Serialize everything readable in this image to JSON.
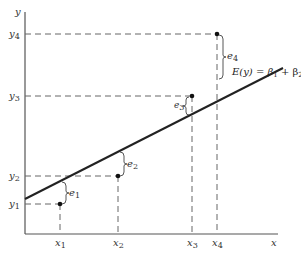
{
  "diagram": {
    "axes": {
      "x_label": "x",
      "y_label": "y"
    },
    "equation": {
      "lhs": "E(y) = β",
      "b1_sub": "1",
      "plus": " + β",
      "b2_sub": "2",
      "x": " x"
    },
    "points": [
      {
        "x_label": "x",
        "x_sub": "1",
        "y_label": "y",
        "y_sub": "1",
        "error_label": "e",
        "error_sub": "1",
        "position": "below line"
      },
      {
        "x_label": "x",
        "x_sub": "2",
        "y_label": "y",
        "y_sub": "2",
        "error_label": "e",
        "error_sub": "2",
        "position": "below line"
      },
      {
        "x_label": "x",
        "x_sub": "3",
        "y_label": "y",
        "y_sub": "3",
        "error_label": "e",
        "error_sub": "3",
        "position": "above line"
      },
      {
        "x_label": "x",
        "x_sub": "4",
        "y_label": "y",
        "y_sub": "4",
        "error_label": "e",
        "error_sub": "4",
        "position": "above line"
      }
    ],
    "colors": {
      "line": "#222222",
      "dashes": "#666666",
      "axis": "#555555",
      "point": "#111111"
    }
  }
}
